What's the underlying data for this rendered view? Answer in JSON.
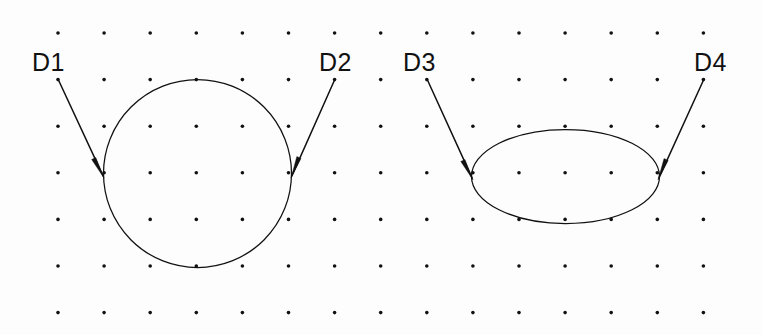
{
  "canvas": {
    "width": 762,
    "height": 335,
    "background_color": "#fdfdfd",
    "ink_color": "#111111"
  },
  "grid": {
    "name": "dot-grid",
    "columns": 15,
    "rows": 7,
    "origin_x": 58,
    "origin_y": 33,
    "spacing_x": 46.1,
    "spacing_y": 46.6,
    "dot_radius": 1.8
  },
  "labels": [
    {
      "id": "D1",
      "text": "D1",
      "x": 32,
      "y": 50
    },
    {
      "id": "D2",
      "text": "D2",
      "x": 319,
      "y": 50
    },
    {
      "id": "D3",
      "text": "D3",
      "x": 403,
      "y": 50
    },
    {
      "id": "D4",
      "text": "D4",
      "x": 694,
      "y": 50
    }
  ],
  "shapes": [
    {
      "id": "circle",
      "type": "circle",
      "center_x": 197.5,
      "center_y": 173.5,
      "radius": 94,
      "stroke": "#111111",
      "stroke_width": 1.25,
      "fill": "none"
    },
    {
      "id": "ellipse",
      "type": "ellipse",
      "center_x": 565.5,
      "center_y": 176.5,
      "radius_x": 94,
      "radius_y": 47,
      "stroke": "#111111",
      "stroke_width": 1.25,
      "fill": "none"
    }
  ],
  "leaders": [
    {
      "id": "D1",
      "label": "D1",
      "start_x": 58,
      "start_y": 79,
      "tip_x": 104,
      "tip_y": 178,
      "target_shape": "circle",
      "target_side": "left"
    },
    {
      "id": "D2",
      "label": "D2",
      "start_x": 335,
      "start_y": 79,
      "tip_x": 291,
      "tip_y": 178,
      "target_shape": "circle",
      "target_side": "right"
    },
    {
      "id": "D3",
      "label": "D3",
      "start_x": 427,
      "start_y": 79,
      "tip_x": 473,
      "tip_y": 180,
      "target_shape": "ellipse",
      "target_side": "left"
    },
    {
      "id": "D4",
      "label": "D4",
      "start_x": 704,
      "start_y": 79,
      "tip_x": 658,
      "tip_y": 180,
      "target_shape": "ellipse",
      "target_side": "right"
    }
  ]
}
